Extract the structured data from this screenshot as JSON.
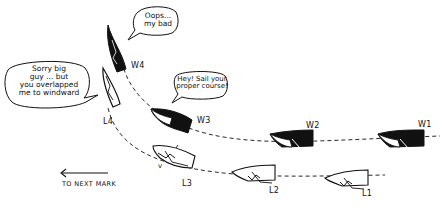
{
  "diagram": {
    "colors": {
      "ink": "#111111",
      "paper": "#ffffff"
    },
    "windward_boats": [
      {
        "id": "W1",
        "label": "W1",
        "fill": "black"
      },
      {
        "id": "W2",
        "label": "W2",
        "fill": "black"
      },
      {
        "id": "W3",
        "label": "W3",
        "fill": "black"
      },
      {
        "id": "W4",
        "label": "W4",
        "fill": "black"
      }
    ],
    "leeward_boats": [
      {
        "id": "L1",
        "label": "L1",
        "fill": "white"
      },
      {
        "id": "L2",
        "label": "L2",
        "fill": "white"
      },
      {
        "id": "L3",
        "label": "L3",
        "fill": "white"
      },
      {
        "id": "L4",
        "label": "L4",
        "fill": "white"
      }
    ],
    "speech_bubbles": [
      {
        "speaker": "W4",
        "line1": "Oops...",
        "line2": "my bad"
      },
      {
        "speaker": "L4",
        "line1": "Sorry big",
        "line2": "guy ... but",
        "line3": "you overlapped",
        "line4": "me to windward"
      },
      {
        "speaker": "W3",
        "line1": "Hey! Sail your",
        "line2": "proper course!"
      }
    ],
    "direction": {
      "arrow": "left-arrow",
      "caption": "TO NEXT MARK"
    },
    "small_mark": "v"
  }
}
